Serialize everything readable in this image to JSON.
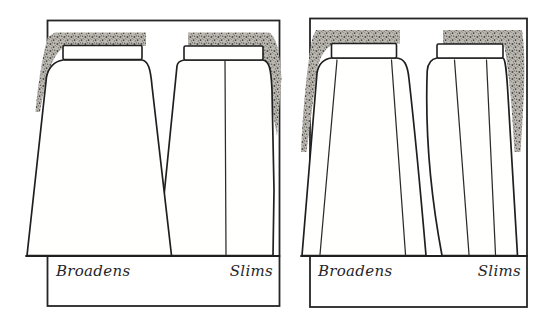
{
  "figure": {
    "ink_color": "#1f1f1f",
    "paper_color": "#ffffff",
    "stipple_color": "#b9b6b0",
    "panels": [
      {
        "id": "panel-plain-skirts",
        "left_label": "Broadens",
        "right_label": "Slims"
      },
      {
        "id": "panel-gored-skirts",
        "left_label": "Broadens",
        "right_label": "Slims"
      }
    ]
  }
}
